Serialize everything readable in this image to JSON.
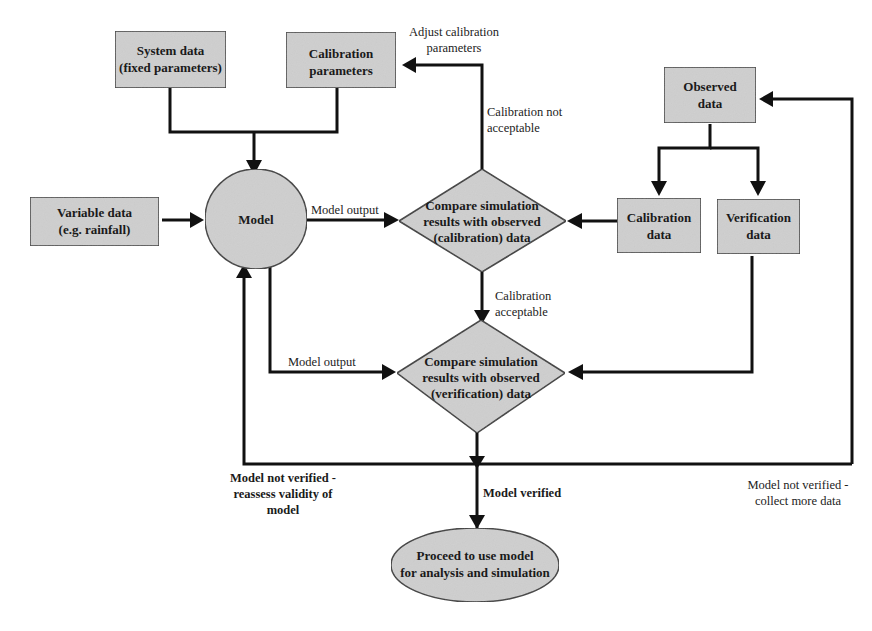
{
  "diagram": {
    "type": "flowchart",
    "colors": {
      "node_fill": "#cfcfcf",
      "stroke": "#111111",
      "background": "#ffffff"
    },
    "nodes": {
      "system_data": {
        "line1": "System data",
        "line2": "(fixed parameters)"
      },
      "calibration_parameters": {
        "line1": "Calibration",
        "line2": "parameters"
      },
      "variable_data": {
        "line1": "Variable data",
        "line2": "(e.g. rainfall)"
      },
      "model": {
        "label": "Model"
      },
      "compare_calibration": {
        "line1": "Compare simulation",
        "line2": "results with observed",
        "line3": "(calibration) data"
      },
      "observed_data": {
        "line1": "Observed",
        "line2": "data"
      },
      "calibration_data": {
        "line1": "Calibration",
        "line2": "data"
      },
      "verification_data": {
        "line1": "Verification",
        "line2": "data"
      },
      "compare_verification": {
        "line1": "Compare simulation",
        "line2": "results with observed",
        "line3": "(verification) data"
      },
      "proceed": {
        "line1": "Proceed to use model",
        "line2": "for analysis and simulation"
      }
    },
    "edge_labels": {
      "adjust_calibration": {
        "line1": "Adjust calibration",
        "line2": "parameters"
      },
      "calibration_not_acceptable": {
        "line1": "Calibration not",
        "line2": "acceptable"
      },
      "model_output_1": "Model output",
      "calibration_acceptable": {
        "line1": "Calibration",
        "line2": "acceptable"
      },
      "model_output_2": "Model output",
      "not_verified_reassess": {
        "line1": "Model not verified -",
        "line2": "reassess validity of",
        "line3": "model"
      },
      "model_verified": "Model verified",
      "not_verified_collect": {
        "line1": "Model not verified -",
        "line2": "collect more data"
      }
    },
    "edges": [
      {
        "from": "system_data",
        "to": "model"
      },
      {
        "from": "calibration_parameters",
        "to": "model"
      },
      {
        "from": "variable_data",
        "to": "model"
      },
      {
        "from": "model",
        "to": "compare_calibration",
        "label": "Model output"
      },
      {
        "from": "compare_calibration",
        "to": "calibration_parameters",
        "label": "Calibration not acceptable / Adjust calibration parameters"
      },
      {
        "from": "calibration_data",
        "to": "compare_calibration"
      },
      {
        "from": "observed_data",
        "to": "calibration_data"
      },
      {
        "from": "observed_data",
        "to": "verification_data"
      },
      {
        "from": "compare_calibration",
        "to": "compare_verification",
        "label": "Calibration acceptable"
      },
      {
        "from": "model",
        "to": "compare_verification",
        "label": "Model output"
      },
      {
        "from": "verification_data",
        "to": "compare_verification"
      },
      {
        "from": "compare_verification",
        "to": "proceed",
        "label": "Model verified"
      },
      {
        "from": "compare_verification",
        "to": "model",
        "label": "Model not verified - reassess validity of model"
      },
      {
        "from": "compare_verification",
        "to": "observed_data",
        "label": "Model not verified - collect more data"
      }
    ]
  }
}
